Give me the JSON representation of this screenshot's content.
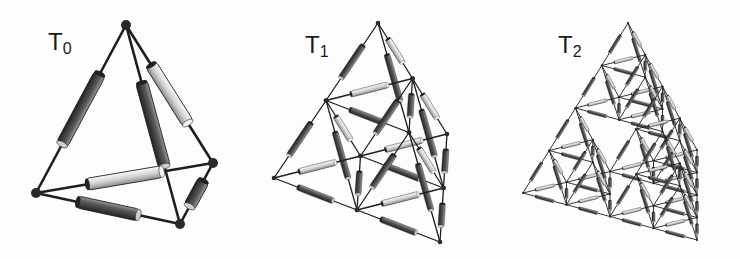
{
  "figure": {
    "panels": [
      {
        "id": "T0",
        "label_main": "T",
        "label_sub": "0",
        "label_pos": [
          48,
          30
        ],
        "level": 0,
        "vertices": {
          "top": [
            126,
            25
          ],
          "left": [
            36,
            193
          ],
          "right": [
            213,
            163
          ],
          "bottom": [
            180,
            224
          ]
        },
        "resistor_width": 12,
        "edge_width": 2.6,
        "node_radius": 5
      },
      {
        "id": "T1",
        "label_main": "T",
        "label_sub": "1",
        "label_pos": [
          305,
          33
        ],
        "level": 1,
        "vertices": {
          "top": [
            378,
            23
          ],
          "left": [
            274,
            178
          ],
          "right": [
            447,
            134
          ],
          "bottom": [
            440,
            242
          ]
        },
        "resistor_width": 6,
        "edge_width": 1.3,
        "node_radius": 2.3
      },
      {
        "id": "T2",
        "label_main": "T",
        "label_sub": "2",
        "label_pos": [
          558,
          33
        ],
        "level": 2,
        "vertices": {
          "top": [
            628,
            23
          ],
          "left": [
            523,
            193
          ],
          "right": [
            697,
            150
          ],
          "bottom": [
            697,
            240
          ]
        },
        "resistor_width": 3,
        "edge_width": 0.9,
        "node_radius": 1
      }
    ],
    "colors": {
      "wire": "#1e1e1e",
      "node": "#2a2a2a",
      "resistor_dark": "#3a3a3a",
      "resistor_light": "#e0e0e0",
      "background": "#fdfdfd"
    }
  }
}
